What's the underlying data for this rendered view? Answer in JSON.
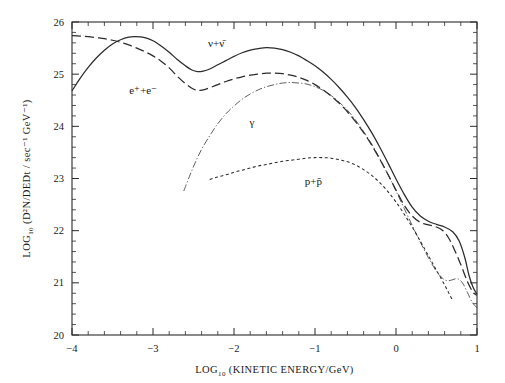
{
  "figure": {
    "axis_titles": {
      "x": "LOG",
      "x_sub": "10",
      "x_rest": " (KINETIC ENERGY/GeV)",
      "y": "LOG",
      "y_sub": "10",
      "y_rest": " (D²N/DEDt / sec⁻¹ GeV⁻¹)"
    }
  },
  "chart_data": {
    "type": "line",
    "title": "",
    "xlabel": "LOG10 (KINETIC ENERGY/GeV)",
    "ylabel": "LOG10 (D2N/DEDt / sec-1 GeV-1)",
    "xlim": [
      -4,
      1
    ],
    "ylim": [
      20,
      26
    ],
    "xticks": [
      -4,
      -3,
      -2,
      -1,
      0,
      1
    ],
    "xticklabels": [
      "−4",
      "−3",
      "−2",
      "−1",
      "0",
      "1"
    ],
    "yticks": [
      20,
      21,
      22,
      23,
      24,
      25,
      26
    ],
    "yticklabels": [
      "20",
      "21",
      "22",
      "23",
      "24",
      "25",
      "26"
    ],
    "x_minor_per_major": 5,
    "y_minor_per_major": 5,
    "grid": false,
    "legend": "inline-annotations",
    "series": [
      {
        "name": "nu + nubar",
        "label": "ν+ν̄",
        "style": "solid",
        "label_x": -2.22,
        "label_y": 25.52,
        "points": [
          [
            -4.0,
            24.68
          ],
          [
            -3.9,
            24.92
          ],
          [
            -3.8,
            25.13
          ],
          [
            -3.7,
            25.31
          ],
          [
            -3.6,
            25.46
          ],
          [
            -3.5,
            25.58
          ],
          [
            -3.4,
            25.66
          ],
          [
            -3.3,
            25.71
          ],
          [
            -3.22,
            25.72
          ],
          [
            -3.1,
            25.7
          ],
          [
            -3.0,
            25.64
          ],
          [
            -2.9,
            25.54
          ],
          [
            -2.8,
            25.42
          ],
          [
            -2.7,
            25.28
          ],
          [
            -2.6,
            25.16
          ],
          [
            -2.52,
            25.08
          ],
          [
            -2.45,
            25.05
          ],
          [
            -2.38,
            25.06
          ],
          [
            -2.3,
            25.1
          ],
          [
            -2.2,
            25.18
          ],
          [
            -2.1,
            25.26
          ],
          [
            -2.0,
            25.34
          ],
          [
            -1.9,
            25.41
          ],
          [
            -1.8,
            25.46
          ],
          [
            -1.7,
            25.49
          ],
          [
            -1.6,
            25.51
          ],
          [
            -1.5,
            25.5
          ],
          [
            -1.4,
            25.47
          ],
          [
            -1.3,
            25.42
          ],
          [
            -1.2,
            25.35
          ],
          [
            -1.1,
            25.26
          ],
          [
            -1.0,
            25.16
          ],
          [
            -0.9,
            25.04
          ],
          [
            -0.8,
            24.9
          ],
          [
            -0.7,
            24.74
          ],
          [
            -0.6,
            24.56
          ],
          [
            -0.5,
            24.36
          ],
          [
            -0.4,
            24.13
          ],
          [
            -0.3,
            23.88
          ],
          [
            -0.2,
            23.6
          ],
          [
            -0.1,
            23.3
          ],
          [
            0.0,
            22.99
          ],
          [
            0.1,
            22.7
          ],
          [
            0.2,
            22.45
          ],
          [
            0.3,
            22.28
          ],
          [
            0.4,
            22.18
          ],
          [
            0.5,
            22.12
          ],
          [
            0.6,
            22.07
          ],
          [
            0.7,
            21.98
          ],
          [
            0.78,
            21.8
          ],
          [
            0.85,
            21.48
          ],
          [
            0.9,
            21.15
          ],
          [
            0.95,
            20.92
          ],
          [
            1.0,
            20.78
          ]
        ]
      },
      {
        "name": "e+ + e-",
        "label": "e⁺+e⁻",
        "style": "dashed",
        "label_x": -3.12,
        "label_y": 24.62,
        "points": [
          [
            -4.0,
            25.74
          ],
          [
            -3.9,
            25.73
          ],
          [
            -3.8,
            25.72
          ],
          [
            -3.7,
            25.7
          ],
          [
            -3.6,
            25.68
          ],
          [
            -3.5,
            25.65
          ],
          [
            -3.4,
            25.61
          ],
          [
            -3.3,
            25.56
          ],
          [
            -3.2,
            25.5
          ],
          [
            -3.1,
            25.43
          ],
          [
            -3.0,
            25.35
          ],
          [
            -2.9,
            25.25
          ],
          [
            -2.8,
            25.12
          ],
          [
            -2.7,
            24.96
          ],
          [
            -2.6,
            24.82
          ],
          [
            -2.52,
            24.73
          ],
          [
            -2.45,
            24.69
          ],
          [
            -2.38,
            24.7
          ],
          [
            -2.3,
            24.74
          ],
          [
            -2.2,
            24.8
          ],
          [
            -2.1,
            24.86
          ],
          [
            -2.0,
            24.91
          ],
          [
            -1.9,
            24.95
          ],
          [
            -1.8,
            24.98
          ],
          [
            -1.7,
            25.0
          ],
          [
            -1.6,
            25.02
          ],
          [
            -1.5,
            25.02
          ],
          [
            -1.4,
            25.01
          ],
          [
            -1.3,
            24.98
          ],
          [
            -1.2,
            24.94
          ],
          [
            -1.1,
            24.88
          ],
          [
            -1.0,
            24.8
          ],
          [
            -0.9,
            24.7
          ],
          [
            -0.8,
            24.58
          ],
          [
            -0.7,
            24.44
          ],
          [
            -0.6,
            24.28
          ],
          [
            -0.5,
            24.09
          ],
          [
            -0.4,
            23.88
          ],
          [
            -0.3,
            23.64
          ],
          [
            -0.2,
            23.37
          ],
          [
            -0.1,
            23.08
          ],
          [
            0.0,
            22.78
          ],
          [
            0.1,
            22.49
          ],
          [
            0.2,
            22.28
          ],
          [
            0.3,
            22.16
          ],
          [
            0.4,
            22.11
          ],
          [
            0.5,
            22.07
          ],
          [
            0.58,
            22.0
          ],
          [
            0.65,
            21.86
          ],
          [
            0.72,
            21.64
          ],
          [
            0.8,
            21.35
          ],
          [
            0.88,
            21.03
          ],
          [
            0.95,
            20.82
          ],
          [
            1.0,
            20.76
          ]
        ]
      },
      {
        "name": "gamma",
        "label": "γ",
        "style": "dashdot",
        "label_x": -1.78,
        "label_y": 24.0,
        "points": [
          [
            -2.62,
            22.76
          ],
          [
            -2.55,
            23.04
          ],
          [
            -2.48,
            23.3
          ],
          [
            -2.4,
            23.56
          ],
          [
            -2.3,
            23.82
          ],
          [
            -2.2,
            24.05
          ],
          [
            -2.1,
            24.24
          ],
          [
            -2.0,
            24.39
          ],
          [
            -1.9,
            24.52
          ],
          [
            -1.8,
            24.62
          ],
          [
            -1.7,
            24.7
          ],
          [
            -1.6,
            24.76
          ],
          [
            -1.5,
            24.8
          ],
          [
            -1.4,
            24.83
          ],
          [
            -1.3,
            24.84
          ],
          [
            -1.2,
            24.83
          ],
          [
            -1.1,
            24.81
          ],
          [
            -1.0,
            24.76
          ],
          [
            -0.9,
            24.69
          ],
          [
            -0.8,
            24.59
          ],
          [
            -0.7,
            24.46
          ],
          [
            -0.6,
            24.31
          ],
          [
            -0.5,
            24.12
          ],
          [
            -0.4,
            23.9
          ],
          [
            -0.3,
            23.66
          ],
          [
            -0.2,
            23.38
          ],
          [
            -0.1,
            23.08
          ],
          [
            0.0,
            22.76
          ],
          [
            0.1,
            22.43
          ],
          [
            0.2,
            22.1
          ],
          [
            0.3,
            21.78
          ],
          [
            0.4,
            21.48
          ],
          [
            0.5,
            21.22
          ],
          [
            0.58,
            21.08
          ],
          [
            0.64,
            21.04
          ],
          [
            0.7,
            21.06
          ],
          [
            0.76,
            21.08
          ],
          [
            0.82,
            21.0
          ],
          [
            0.88,
            20.82
          ],
          [
            0.94,
            20.63
          ],
          [
            1.0,
            20.52
          ]
        ]
      },
      {
        "name": "p + pbar",
        "label": "p+p̄",
        "style": "dotted",
        "label_x": -1.02,
        "label_y": 22.88,
        "points": [
          [
            -2.3,
            22.98
          ],
          [
            -2.2,
            23.03
          ],
          [
            -2.1,
            23.07
          ],
          [
            -2.0,
            23.12
          ],
          [
            -1.9,
            23.16
          ],
          [
            -1.8,
            23.2
          ],
          [
            -1.7,
            23.24
          ],
          [
            -1.6,
            23.27
          ],
          [
            -1.5,
            23.3
          ],
          [
            -1.4,
            23.33
          ],
          [
            -1.3,
            23.35
          ],
          [
            -1.2,
            23.37
          ],
          [
            -1.1,
            23.39
          ],
          [
            -1.0,
            23.4
          ],
          [
            -0.9,
            23.4
          ],
          [
            -0.8,
            23.39
          ],
          [
            -0.7,
            23.36
          ],
          [
            -0.6,
            23.32
          ],
          [
            -0.5,
            23.26
          ],
          [
            -0.4,
            23.17
          ],
          [
            -0.3,
            23.06
          ],
          [
            -0.2,
            22.92
          ],
          [
            -0.1,
            22.75
          ],
          [
            0.0,
            22.55
          ],
          [
            0.1,
            22.32
          ],
          [
            0.2,
            22.07
          ],
          [
            0.3,
            21.8
          ],
          [
            0.4,
            21.52
          ],
          [
            0.5,
            21.24
          ],
          [
            0.6,
            20.96
          ],
          [
            0.66,
            20.78
          ],
          [
            0.7,
            20.66
          ]
        ]
      }
    ]
  }
}
